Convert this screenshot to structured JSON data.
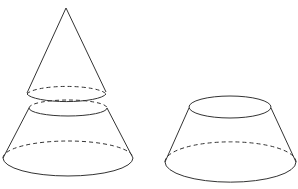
{
  "diagram": {
    "stroke_color": "#333333",
    "background": "#ffffff",
    "figures": [
      {
        "name": "cut-cone",
        "parts": [
          "small-cone-top",
          "frustum-bottom"
        ]
      },
      {
        "name": "frustum",
        "parts": [
          "top-face",
          "bottom-face",
          "lateral-surface"
        ]
      }
    ]
  }
}
